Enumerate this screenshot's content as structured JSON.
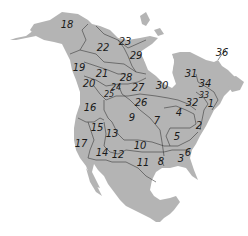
{
  "map": {
    "land_color": "#b4b4b4",
    "border_color": "#3a3a3a",
    "water_color": "#ffffff",
    "regions": [
      {
        "id": "1",
        "x": 211,
        "y": 104,
        "small": false
      },
      {
        "id": "2",
        "x": 199,
        "y": 126,
        "small": false
      },
      {
        "id": "3",
        "x": 181,
        "y": 159,
        "small": false
      },
      {
        "id": "4",
        "x": 179,
        "y": 113,
        "small": false
      },
      {
        "id": "5",
        "x": 177,
        "y": 137,
        "small": false
      },
      {
        "id": "6",
        "x": 188,
        "y": 153,
        "small": false
      },
      {
        "id": "7",
        "x": 157,
        "y": 121,
        "small": false
      },
      {
        "id": "8",
        "x": 161,
        "y": 162,
        "small": false
      },
      {
        "id": "9",
        "x": 132,
        "y": 118,
        "small": false
      },
      {
        "id": "10",
        "x": 140,
        "y": 146,
        "small": false
      },
      {
        "id": "11",
        "x": 143,
        "y": 163,
        "small": false
      },
      {
        "id": "12",
        "x": 118,
        "y": 155,
        "small": false
      },
      {
        "id": "13",
        "x": 112,
        "y": 134,
        "small": false
      },
      {
        "id": "14",
        "x": 102,
        "y": 153,
        "small": false
      },
      {
        "id": "15",
        "x": 97,
        "y": 128,
        "small": false
      },
      {
        "id": "16",
        "x": 90,
        "y": 108,
        "small": false
      },
      {
        "id": "17",
        "x": 81,
        "y": 144,
        "small": false
      },
      {
        "id": "18",
        "x": 67,
        "y": 25,
        "small": false
      },
      {
        "id": "19",
        "x": 79,
        "y": 68,
        "small": false
      },
      {
        "id": "20",
        "x": 89,
        "y": 84,
        "small": false
      },
      {
        "id": "21",
        "x": 102,
        "y": 74,
        "small": false
      },
      {
        "id": "22",
        "x": 103,
        "y": 48,
        "small": false
      },
      {
        "id": "23",
        "x": 125,
        "y": 42,
        "small": false
      },
      {
        "id": "24",
        "x": 116,
        "y": 88,
        "small": true
      },
      {
        "id": "25",
        "x": 109,
        "y": 95,
        "small": true
      },
      {
        "id": "26",
        "x": 141,
        "y": 103,
        "small": false
      },
      {
        "id": "27",
        "x": 138,
        "y": 88,
        "small": false
      },
      {
        "id": "28",
        "x": 126,
        "y": 78,
        "small": false
      },
      {
        "id": "29",
        "x": 136,
        "y": 56,
        "small": false
      },
      {
        "id": "30",
        "x": 162,
        "y": 86,
        "small": false
      },
      {
        "id": "31",
        "x": 191,
        "y": 74,
        "small": false
      },
      {
        "id": "32",
        "x": 192,
        "y": 103,
        "small": false
      },
      {
        "id": "33",
        "x": 204,
        "y": 96,
        "small": true
      },
      {
        "id": "34",
        "x": 205,
        "y": 84,
        "small": false
      },
      {
        "id": "36",
        "x": 222,
        "y": 53,
        "small": false
      }
    ]
  }
}
